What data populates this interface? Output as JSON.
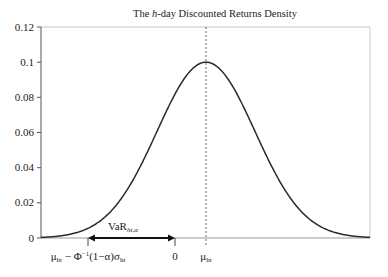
{
  "chart_data": {
    "type": "line",
    "title": "The h-day Discounted Returns Density",
    "title_parts": {
      "prefix": "The ",
      "italic": "h",
      "suffix": "-day Discounted Returns Density"
    },
    "xlabel": "",
    "ylabel": "",
    "ylim": [
      0,
      0.12
    ],
    "y_ticks": [
      "0",
      "0.02",
      "0.04",
      "0.06",
      "0.08",
      "0.1",
      "0.12"
    ],
    "y_tick_values": [
      0,
      0.02,
      0.04,
      0.06,
      0.08,
      0.1,
      0.12
    ],
    "grid": false,
    "legend": null,
    "series": [
      {
        "name": "Discounted returns density (normal)",
        "description": "Normal density centered at mu_ht with peak value approximately 0.1",
        "peak_value": 0.1,
        "x_relative_to_mean_in_sigma": [
          -3.4,
          -3,
          -2.5,
          -2,
          -1.5,
          -1,
          -0.5,
          0,
          0.5,
          1,
          1.5,
          2,
          2.5,
          3,
          3.3
        ],
        "values": [
          0.0003,
          0.0011,
          0.0044,
          0.0135,
          0.0325,
          0.0607,
          0.0882,
          0.1,
          0.0882,
          0.0607,
          0.0325,
          0.0135,
          0.0044,
          0.0011,
          0.0004
        ]
      }
    ],
    "x_markers": [
      {
        "label": "μ_ht − Φ⁻¹(1−α)σ_ht",
        "position_sigma": -2.4,
        "type": "tick"
      },
      {
        "label": "0",
        "position_sigma": -0.63,
        "type": "tick"
      },
      {
        "label": "μ_ht",
        "position_sigma": 0,
        "type": "dashed-vertical-line"
      }
    ],
    "annotations": [
      {
        "text": "VaR_ht,α",
        "type": "double-arrow",
        "from": "μ_ht − Φ⁻¹(1−α)σ_ht",
        "to": "0"
      }
    ]
  },
  "labels": {
    "title_prefix": "The ",
    "title_italic": "h",
    "title_suffix": "-day Discounted Returns Density",
    "y_ticks": [
      "0",
      "0.02",
      "0.04",
      "0.06",
      "0.08",
      "0.1",
      "0.12"
    ],
    "var_main": "VaR",
    "var_sub": "ht,α",
    "left_marker_mu": "μ",
    "left_marker_mu_sub": "ht",
    "left_marker_rest": " − Φ",
    "left_marker_sup": "−1",
    "left_marker_paren": "(1−α)σ",
    "left_marker_sigma_sub": "ht",
    "zero_marker": "0",
    "mu_marker": "μ",
    "mu_marker_sub": "ht"
  }
}
